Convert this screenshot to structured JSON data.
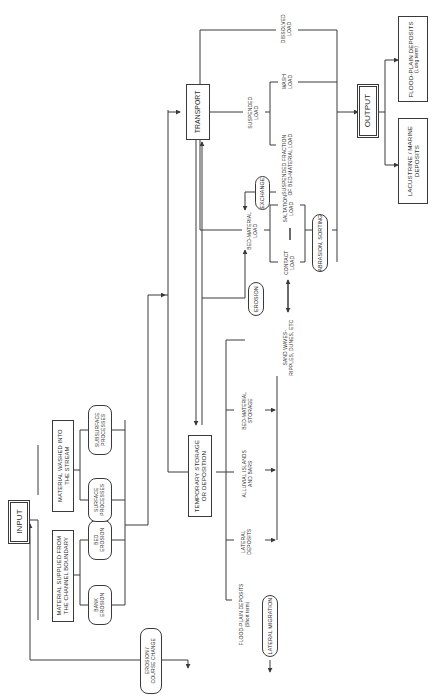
{
  "diagram": {
    "type": "flowchart",
    "orientation": "rotated-90-ccw",
    "nodes": {
      "input": "INPUT",
      "material_supplied": [
        "MATERIAL SUPPLIED FROM",
        "THE CHANNEL BOUNDARY"
      ],
      "material_washed": [
        "MATERIAL WASHED INTO",
        "THE STREAM"
      ],
      "bank_erosion": [
        "BANK",
        "EROSION"
      ],
      "bed_erosion": [
        "BED",
        "EROSION"
      ],
      "surface_processes": [
        "SURFACE",
        "PROCESSES"
      ],
      "subsurface_processes": [
        "SUBSURFACE",
        "PROCESSES"
      ],
      "erosion_course_change": [
        "EROSION /",
        "COURSE CHANGE"
      ],
      "temporary_storage": [
        "TEMPORARY STORAGE",
        "OR DEPOSITION"
      ],
      "flood_plain_short": [
        "FLOOD-PLAIN DEPOSITS",
        "(Short term)"
      ],
      "lateral_deposits": [
        "LATERAL",
        "DEPOSITS"
      ],
      "alluvial_islands": [
        "ALLUVIAL ISLANDS",
        "AND BARS"
      ],
      "bed_material_storage": [
        "BED-MATERIAL",
        "STORAGE"
      ],
      "lateral_migration": "LATERAL MIGRATION",
      "sand_waves": [
        "SAND WAVES-",
        "RIPPLES, DUNES, ETC"
      ],
      "erosion": "EROSION",
      "transport": "TRANSPORT",
      "bed_material_load": [
        "BED-MATERIAL",
        "LOAD"
      ],
      "contact_load": [
        "CONTACT",
        "LOAD"
      ],
      "saltation_load": [
        "SALTATION",
        "LOAD"
      ],
      "abrasion_sorting": "ABRASION, SORTING",
      "exchange": "EXCHANGE",
      "suspended_fraction": [
        "SUSPENDED FRACTION",
        "OF BED-MATERIAL LOAD"
      ],
      "suspended_load": [
        "SUSPENDED",
        "LOAD"
      ],
      "wash_load": [
        "WASH",
        "LOAD"
      ],
      "dissolved_load": [
        "DISSOLVED",
        "LOAD"
      ],
      "output": "OUTPUT",
      "lacustrine_marine": [
        "LACUSTRINE / MARINE",
        "DEPOSITS"
      ],
      "flood_plain_long": [
        "FLOOD-PLAIN DEPOSITS",
        "(Long term)"
      ]
    },
    "colors": {
      "line": "#3a3a3a",
      "background": "#ffffff"
    }
  }
}
